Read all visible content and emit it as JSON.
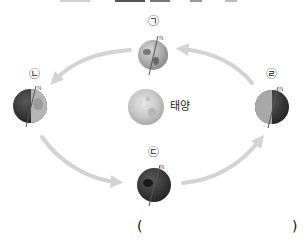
{
  "diagram": {
    "title": "",
    "sun": {
      "label": "태양",
      "cx": 146,
      "cy": 107,
      "r": 18
    },
    "positions": [
      {
        "id": "giyeok",
        "marker": "㉠",
        "label_x": 153,
        "label_y": 21,
        "cx": 153,
        "cy": 55,
        "r": 15,
        "phase": "mostly-lit"
      },
      {
        "id": "nieun",
        "marker": "㉡",
        "label_x": 34,
        "label_y": 74,
        "cx": 30,
        "cy": 106,
        "r": 17,
        "phase": "half-lit-right"
      },
      {
        "id": "digeut",
        "marker": "㉢",
        "label_x": 153,
        "label_y": 152,
        "cx": 154,
        "cy": 185,
        "r": 17,
        "phase": "dark"
      },
      {
        "id": "rieul",
        "marker": "㉣",
        "label_x": 271,
        "label_y": 74,
        "cx": 272,
        "cy": 107,
        "r": 17,
        "phase": "half-lit-left"
      }
    ],
    "arrows": [
      {
        "from": "rieul",
        "to": "giyeok",
        "direction": "counterclockwise"
      },
      {
        "from": "giyeok",
        "to": "nieun",
        "direction": "counterclockwise"
      },
      {
        "from": "nieun",
        "to": "digeut",
        "direction": "counterclockwise"
      },
      {
        "from": "digeut",
        "to": "rieul",
        "direction": "counterclockwise"
      }
    ],
    "answer": {
      "open": "(",
      "close": ")",
      "value": ""
    },
    "colors": {
      "arrow": "#d3d3d3",
      "globe_dark": "#3a3a3a",
      "globe_light": "#bdbdbd",
      "sun": "#c8c8c8",
      "text": "#222222"
    }
  }
}
